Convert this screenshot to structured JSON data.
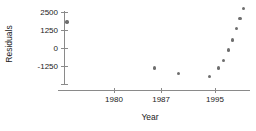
{
  "chart_data": {
    "type": "scatter",
    "title": "",
    "xlabel": "Year",
    "ylabel": "Residuals",
    "xlim": [
      1971,
      2001
    ],
    "ylim": [
      -2400,
      2950
    ],
    "xticks": [
      1980,
      1987,
      1995
    ],
    "xtick_labels": [
      "1980",
      "1987",
      "1995"
    ],
    "yticks": [
      2500,
      1250,
      0,
      -1250
    ],
    "ytick_labels": [
      "2500",
      "1250",
      "0",
      "-1250"
    ],
    "grid": false,
    "legend": null,
    "marker": {
      "shape": "circle",
      "color": "#6e6e6e",
      "size": 3.4
    },
    "axis_color": "#8a8a8a",
    "points": [
      {
        "x": 1973.0,
        "y": 1800
      },
      {
        "x": 1986.0,
        "y": -1400
      },
      {
        "x": 1989.6,
        "y": -1750
      },
      {
        "x": 1994.2,
        "y": -1960
      },
      {
        "x": 1995.5,
        "y": -1400
      },
      {
        "x": 1996.3,
        "y": -850
      },
      {
        "x": 1997.0,
        "y": -150
      },
      {
        "x": 1997.6,
        "y": 550
      },
      {
        "x": 1998.2,
        "y": 1350
      },
      {
        "x": 1998.7,
        "y": 2050
      },
      {
        "x": 1999.2,
        "y": 2750
      }
    ]
  }
}
